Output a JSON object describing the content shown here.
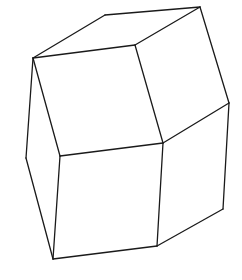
{
  "figure": {
    "width": 242,
    "height": 280,
    "background": "#ffffff",
    "stroke_color": "#1a1a1a",
    "stroke_width": 1.3,
    "vertices": {
      "top_back": [
        105,
        15
      ],
      "top_right": [
        200,
        7
      ],
      "left_top": [
        33,
        58
      ],
      "top_center": [
        135,
        45
      ],
      "right_mid": [
        229,
        103
      ],
      "center": [
        163,
        143
      ],
      "left_mid": [
        26,
        158
      ],
      "left_center": [
        60,
        156
      ],
      "bottom_left": [
        53,
        259
      ],
      "bottom_center": [
        157,
        246
      ],
      "bottom_right": [
        223,
        209
      ]
    },
    "edges": [
      [
        "left_top",
        "top_back"
      ],
      [
        "top_back",
        "top_right"
      ],
      [
        "left_top",
        "top_center"
      ],
      [
        "top_center",
        "top_right"
      ],
      [
        "top_right",
        "right_mid"
      ],
      [
        "top_center",
        "center"
      ],
      [
        "left_top",
        "left_mid"
      ],
      [
        "left_top",
        "left_center"
      ],
      [
        "left_center",
        "center"
      ],
      [
        "center",
        "right_mid"
      ],
      [
        "right_mid",
        "bottom_right"
      ],
      [
        "left_mid",
        "bottom_left"
      ],
      [
        "left_center",
        "bottom_left"
      ],
      [
        "center",
        "bottom_center"
      ],
      [
        "bottom_left",
        "bottom_center"
      ],
      [
        "bottom_center",
        "bottom_right"
      ]
    ]
  }
}
